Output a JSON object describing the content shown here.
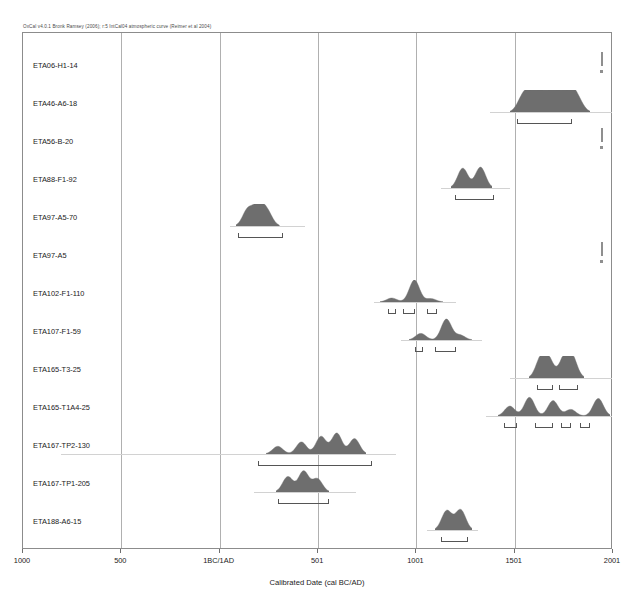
{
  "header": {
    "note": "OxCal v4.0.1 Bronk Ramsey (2006); r:5 IntCal04 atmospheric curve (Reimer et al 2004)"
  },
  "axis": {
    "title": "Calibrated Date (cal BC/AD)",
    "ticks": [
      {
        "label": "1000",
        "value": -1000
      },
      {
        "label": "500",
        "value": -500
      },
      {
        "label": "1BC/1AD",
        "value": 0
      },
      {
        "label": "501",
        "value": 501
      },
      {
        "label": "1001",
        "value": 1001
      },
      {
        "label": "1501",
        "value": 1501
      },
      {
        "label": "2001",
        "value": 2001
      }
    ],
    "min": -1000,
    "max": 2001,
    "gridlines": [
      -500,
      0,
      501,
      1001,
      1501
    ]
  },
  "style": {
    "dist_fill": "#6e6e6e",
    "frame_color": "#8c8c8c",
    "grid_color": "#b0b0b0",
    "baseline_color": "#d2d2d2",
    "range_color": "#555555"
  },
  "chart_data": {
    "type": "area",
    "xlabel": "Calibrated Date (cal BC/AD)",
    "ylabel": "",
    "xlim": [
      -1000,
      2001
    ],
    "grid": true,
    "legend": "none",
    "samples": [
      {
        "label": "ETA06-H1-14",
        "kind": "spike",
        "spike_center": 1950,
        "baseline": null,
        "ranges": [],
        "peaks": []
      },
      {
        "label": "ETA46-A6-18",
        "kind": "distribution",
        "baseline": [
          1380,
          2001
        ],
        "ranges": [
          [
            1520,
            1800
          ]
        ],
        "peaks": [
          {
            "x": 1540,
            "h": 0.55
          },
          {
            "x": 1580,
            "h": 0.85
          },
          {
            "x": 1625,
            "h": 0.7
          },
          {
            "x": 1660,
            "h": 0.92
          },
          {
            "x": 1700,
            "h": 0.6
          },
          {
            "x": 1740,
            "h": 0.8
          },
          {
            "x": 1790,
            "h": 0.95
          },
          {
            "x": 1830,
            "h": 0.45
          }
        ]
      },
      {
        "label": "ETA56-B-20",
        "kind": "spike",
        "spike_center": 1950,
        "baseline": null,
        "ranges": [],
        "peaks": []
      },
      {
        "label": "ETA88-F1-92",
        "kind": "distribution",
        "baseline": [
          1130,
          1480
        ],
        "ranges": [
          [
            1200,
            1400
          ]
        ],
        "peaks": [
          {
            "x": 1240,
            "h": 0.9
          },
          {
            "x": 1330,
            "h": 0.95
          }
        ]
      },
      {
        "label": "ETA97-A5-70",
        "kind": "distribution",
        "baseline": [
          60,
          440
        ],
        "ranges": [
          [
            100,
            330
          ]
        ],
        "peaks": [
          {
            "x": 150,
            "h": 0.75
          },
          {
            "x": 205,
            "h": 0.95
          },
          {
            "x": 250,
            "h": 0.6
          }
        ]
      },
      {
        "label": "ETA97-A5",
        "kind": "spike",
        "spike_center": 1950,
        "baseline": null,
        "ranges": [],
        "peaks": []
      },
      {
        "label": "ETA102-F1-110",
        "kind": "distribution",
        "baseline": [
          790,
          1210
        ],
        "ranges": [
          [
            860,
            900
          ],
          [
            940,
            1000
          ],
          [
            1060,
            1110
          ]
        ],
        "peaks": [
          {
            "x": 880,
            "h": 0.18
          },
          {
            "x": 995,
            "h": 1.0
          },
          {
            "x": 1080,
            "h": 0.15
          }
        ]
      },
      {
        "label": "ETA107-F1-59",
        "kind": "distribution",
        "baseline": [
          930,
          1340
        ],
        "ranges": [
          [
            1000,
            1040
          ],
          [
            1100,
            1210
          ]
        ],
        "peaks": [
          {
            "x": 1030,
            "h": 0.3
          },
          {
            "x": 1160,
            "h": 0.95
          },
          {
            "x": 1230,
            "h": 0.22
          }
        ]
      },
      {
        "label": "ETA165-T3-25",
        "kind": "distribution",
        "baseline": [
          1480,
          2001
        ],
        "ranges": [
          [
            1620,
            1700
          ],
          [
            1730,
            1830
          ]
        ],
        "peaks": [
          {
            "x": 1640,
            "h": 0.85
          },
          {
            "x": 1680,
            "h": 0.8
          },
          {
            "x": 1760,
            "h": 0.9
          },
          {
            "x": 1800,
            "h": 0.88
          }
        ]
      },
      {
        "label": "ETA165-T1A4-25",
        "kind": "distribution",
        "baseline": [
          1360,
          2001
        ],
        "ranges": [
          [
            1450,
            1520
          ],
          [
            1610,
            1700
          ],
          [
            1740,
            1790
          ],
          [
            1840,
            1890
          ]
        ],
        "peaks": [
          {
            "x": 1480,
            "h": 0.45
          },
          {
            "x": 1580,
            "h": 0.85
          },
          {
            "x": 1700,
            "h": 0.7
          },
          {
            "x": 1790,
            "h": 0.3
          },
          {
            "x": 1930,
            "h": 0.8
          }
        ]
      },
      {
        "label": "ETA167-TP2-130",
        "kind": "distribution",
        "baseline": [
          -800,
          900
        ],
        "ranges": [
          [
            200,
            780
          ]
        ],
        "peaks": [
          {
            "x": 300,
            "h": 0.35
          },
          {
            "x": 420,
            "h": 0.55
          },
          {
            "x": 520,
            "h": 0.8
          },
          {
            "x": 600,
            "h": 0.95
          },
          {
            "x": 690,
            "h": 0.7
          }
        ]
      },
      {
        "label": "ETA167-TP1-205",
        "kind": "distribution",
        "baseline": [
          180,
          700
        ],
        "ranges": [
          [
            300,
            560
          ]
        ],
        "peaks": [
          {
            "x": 350,
            "h": 0.7
          },
          {
            "x": 430,
            "h": 0.95
          },
          {
            "x": 500,
            "h": 0.6
          }
        ]
      },
      {
        "label": "ETA188-A6-15",
        "kind": "distribution",
        "baseline": [
          1060,
          1320
        ],
        "ranges": [
          [
            1130,
            1270
          ]
        ],
        "peaks": [
          {
            "x": 1160,
            "h": 0.88
          },
          {
            "x": 1230,
            "h": 0.92
          }
        ]
      }
    ]
  }
}
